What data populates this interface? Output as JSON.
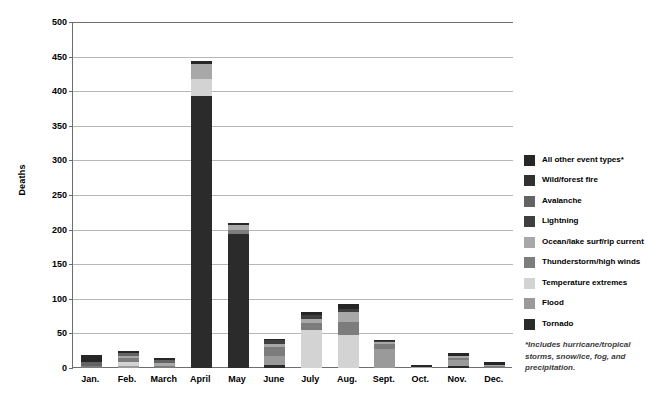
{
  "chart_data": {
    "type": "bar",
    "stacked": true,
    "title": "",
    "xlabel": "",
    "ylabel": "Deaths",
    "ylim": [
      0,
      500
    ],
    "ytick_step": 50,
    "ytick_labels": [
      "500",
      "450",
      "400",
      "350",
      "300",
      "250",
      "200",
      "150",
      "100",
      "50",
      "0"
    ],
    "grid": true,
    "legend_position": "right",
    "categories": [
      "Jan.",
      "Feb.",
      "March",
      "April",
      "May",
      "June",
      "July",
      "Aug.",
      "Sept.",
      "Oct.",
      "Nov.",
      "Dec."
    ],
    "series": [
      {
        "name": "Tornado",
        "color": "#2b2b2b",
        "values": [
          0,
          0,
          0,
          393,
          193,
          5,
          0,
          0,
          0,
          0,
          3,
          0
        ]
      },
      {
        "name": "Flood",
        "color": "#9a9a9a",
        "values": [
          0,
          3,
          0,
          0,
          0,
          12,
          0,
          0,
          28,
          0,
          8,
          0
        ]
      },
      {
        "name": "Temperature extremes",
        "color": "#d3d3d3",
        "values": [
          0,
          5,
          0,
          24,
          0,
          0,
          55,
          47,
          0,
          0,
          0,
          0
        ]
      },
      {
        "name": "Thunderstorm/high winds",
        "color": "#7c7c7c",
        "values": [
          3,
          6,
          3,
          0,
          6,
          14,
          10,
          20,
          6,
          0,
          4,
          3
        ]
      },
      {
        "name": "Ocean/lake surf/rip current",
        "color": "#a8a8a8",
        "values": [
          0,
          4,
          4,
          22,
          7,
          4,
          6,
          14,
          4,
          2,
          2,
          2
        ]
      },
      {
        "name": "Lightning",
        "color": "#3f3f3f",
        "values": [
          0,
          0,
          0,
          0,
          0,
          5,
          6,
          5,
          1,
          0,
          0,
          0
        ]
      },
      {
        "name": "Avalanche",
        "color": "#636363",
        "values": [
          6,
          4,
          5,
          0,
          0,
          0,
          0,
          0,
          0,
          0,
          0,
          0
        ]
      },
      {
        "name": "Wild/forest fire",
        "color": "#313131",
        "values": [
          0,
          0,
          0,
          0,
          0,
          0,
          0,
          0,
          0,
          0,
          0,
          0
        ]
      },
      {
        "name": "All other event types*",
        "color": "#262626",
        "values": [
          10,
          3,
          3,
          4,
          3,
          2,
          4,
          7,
          2,
          3,
          5,
          3
        ]
      }
    ],
    "totals": [
      19,
      25,
      15,
      443,
      209,
      42,
      81,
      93,
      41,
      5,
      22,
      8
    ]
  },
  "legend": {
    "items": [
      {
        "label": "All other event types*",
        "color": "#262626"
      },
      {
        "label": "Wild/forest fire",
        "color": "#313131"
      },
      {
        "label": "Avalanche",
        "color": "#636363"
      },
      {
        "label": "Lightning",
        "color": "#3f3f3f"
      },
      {
        "label": "Ocean/lake surf/rip current",
        "color": "#a8a8a8"
      },
      {
        "label": "Thunderstorm/high winds",
        "color": "#7c7c7c"
      },
      {
        "label": "Temperature extremes",
        "color": "#d3d3d3"
      },
      {
        "label": "Flood",
        "color": "#9a9a9a"
      },
      {
        "label": "Tornado",
        "color": "#2b2b2b"
      }
    ]
  },
  "footnote": "*Includes hurricane/tropical storms, snow/ice, fog, and precipitation.",
  "axis": {
    "y_title": "Deaths"
  },
  "colors": {
    "gridline": "#b7b7b7",
    "axis": "#6d6d6d",
    "text": "#000000",
    "footnote_text": "#3b3b3b"
  }
}
